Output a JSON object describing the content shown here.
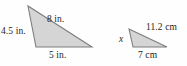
{
  "figure": {
    "name": "similar-triangles-figure",
    "background_color": "#fefefe",
    "fill_color": "#d5d5d5",
    "stroke_color": "#808080",
    "text_color": "#1d1d1d",
    "triangles": [
      {
        "id": "left-triangle",
        "unit": "in.",
        "vertices": [
          {
            "name": "apex",
            "x": 28,
            "y": 6
          },
          {
            "name": "bottom-left",
            "x": 36,
            "y": 47
          },
          {
            "name": "bottom-right",
            "x": 92,
            "y": 47
          }
        ],
        "side_labels": [
          {
            "id": "left-side",
            "text": "4.5 in.",
            "value": 4.5,
            "unit": "in.",
            "side": "apex-to-bottom-left"
          },
          {
            "id": "hypotenuse",
            "text": "8 in.",
            "value": 8,
            "unit": "in.",
            "side": "apex-to-bottom-right"
          },
          {
            "id": "base",
            "text": "5 in.",
            "value": 5,
            "unit": "in.",
            "side": "bottom-left-to-bottom-right"
          }
        ]
      },
      {
        "id": "right-triangle",
        "unit": "cm",
        "vertices": [
          {
            "name": "apex",
            "x": 129,
            "y": 29
          },
          {
            "name": "bottom-left",
            "x": 133,
            "y": 47
          },
          {
            "name": "bottom-right",
            "x": 167,
            "y": 47
          }
        ],
        "side_labels": [
          {
            "id": "left-side",
            "text": "x",
            "value": null,
            "unit": "cm",
            "side": "apex-to-bottom-left",
            "italic": true
          },
          {
            "id": "hypotenuse",
            "text": "11.2 cm",
            "value": 11.2,
            "unit": "cm",
            "side": "apex-to-bottom-right"
          },
          {
            "id": "base",
            "text": "7 cm",
            "value": 7,
            "unit": "cm",
            "side": "bottom-left-to-bottom-right"
          }
        ]
      }
    ]
  }
}
